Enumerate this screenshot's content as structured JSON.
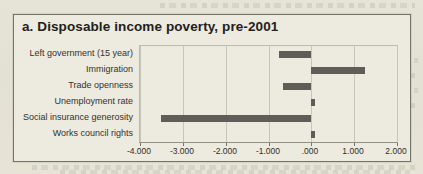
{
  "chart_data": {
    "type": "bar",
    "orientation": "horizontal",
    "title": "a. Disposable income poverty, pre-2001",
    "categories": [
      "Left government (15 year)",
      "Immigration",
      "Trade openness",
      "Unemployment rate",
      "Social insurance generosity",
      "Works council rights"
    ],
    "values": [
      -0.75,
      1.25,
      -0.65,
      0.1,
      -3.5,
      0.1
    ],
    "xlabel": "",
    "ylabel": "",
    "xlim": [
      -4.0,
      2.0
    ],
    "xticks": [
      -4,
      -3,
      -2,
      -1,
      0,
      1,
      2
    ],
    "xtick_labels": [
      "-4.000",
      "-3.000",
      "-2.000",
      "-1.000",
      ".000",
      "1.000",
      "2.000"
    ],
    "grid": true,
    "legend": false,
    "bar_color": "#5e5d58",
    "gridline_color": "#c8c5b9"
  }
}
